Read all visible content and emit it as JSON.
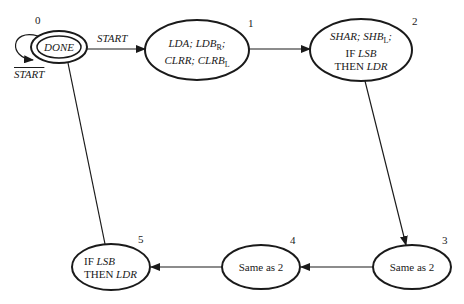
{
  "states": [
    {
      "id": "0",
      "number": "0",
      "lines": [
        "DONE"
      ],
      "accepting": true
    },
    {
      "id": "1",
      "number": "1",
      "line1a": "LDA; LDB",
      "line1sub": "R",
      "line1b": ";",
      "line2a": "CLRR; CLRB",
      "line2sub": "L"
    },
    {
      "id": "2",
      "number": "2",
      "line1a": "SHAR; SHB",
      "line1sub": "L",
      "line1b": ";",
      "line2pre": "IF ",
      "line2it": "LSB",
      "line3pre": "THEN ",
      "line3it": "LDR"
    },
    {
      "id": "3",
      "number": "3",
      "text": "Same as 2"
    },
    {
      "id": "4",
      "number": "4",
      "text": "Same as 2"
    },
    {
      "id": "5",
      "number": "5",
      "line1pre": "IF ",
      "line1it": "LSB",
      "line2pre": "THEN ",
      "line2it": "LDR"
    }
  ],
  "transitions": [
    {
      "from": "0",
      "to": "1",
      "label": "START"
    },
    {
      "from": "0",
      "to": "0",
      "label": "START",
      "negated": true
    },
    {
      "from": "1",
      "to": "2",
      "label": ""
    },
    {
      "from": "2",
      "to": "3",
      "label": ""
    },
    {
      "from": "3",
      "to": "4",
      "label": ""
    },
    {
      "from": "4",
      "to": "5",
      "label": ""
    },
    {
      "from": "5",
      "to": "0",
      "label": ""
    }
  ]
}
